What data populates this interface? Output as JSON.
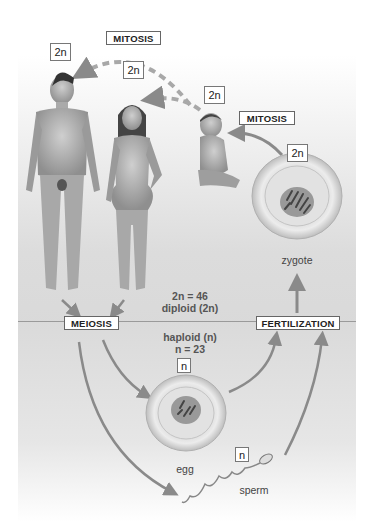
{
  "diagram": {
    "labels": {
      "mitosis_top": "MITOSIS",
      "mitosis_right": "MITOSIS",
      "meiosis": "MEIOSIS",
      "fertilization": "FERTILIZATION"
    },
    "ploidy_boxes": {
      "man": "2n",
      "woman": "2n",
      "baby": "2n",
      "zygote": "2n",
      "egg": "n",
      "sperm": "n"
    },
    "annotations": {
      "diploid_count": "2n = 46",
      "diploid_label": "diploid (2n)",
      "haploid_label": "haploid (n)",
      "haploid_count": "n = 23"
    },
    "cell_labels": {
      "zygote": "zygote",
      "egg": "egg",
      "sperm": "sperm"
    },
    "figures": [
      "adult male",
      "adult female",
      "infant"
    ],
    "colors": {
      "arrow": "#8a8a8a",
      "upper_bg": "#d8d8d8",
      "lower_bg": "#e3e3e3",
      "divider": "#9a9a9a"
    }
  }
}
